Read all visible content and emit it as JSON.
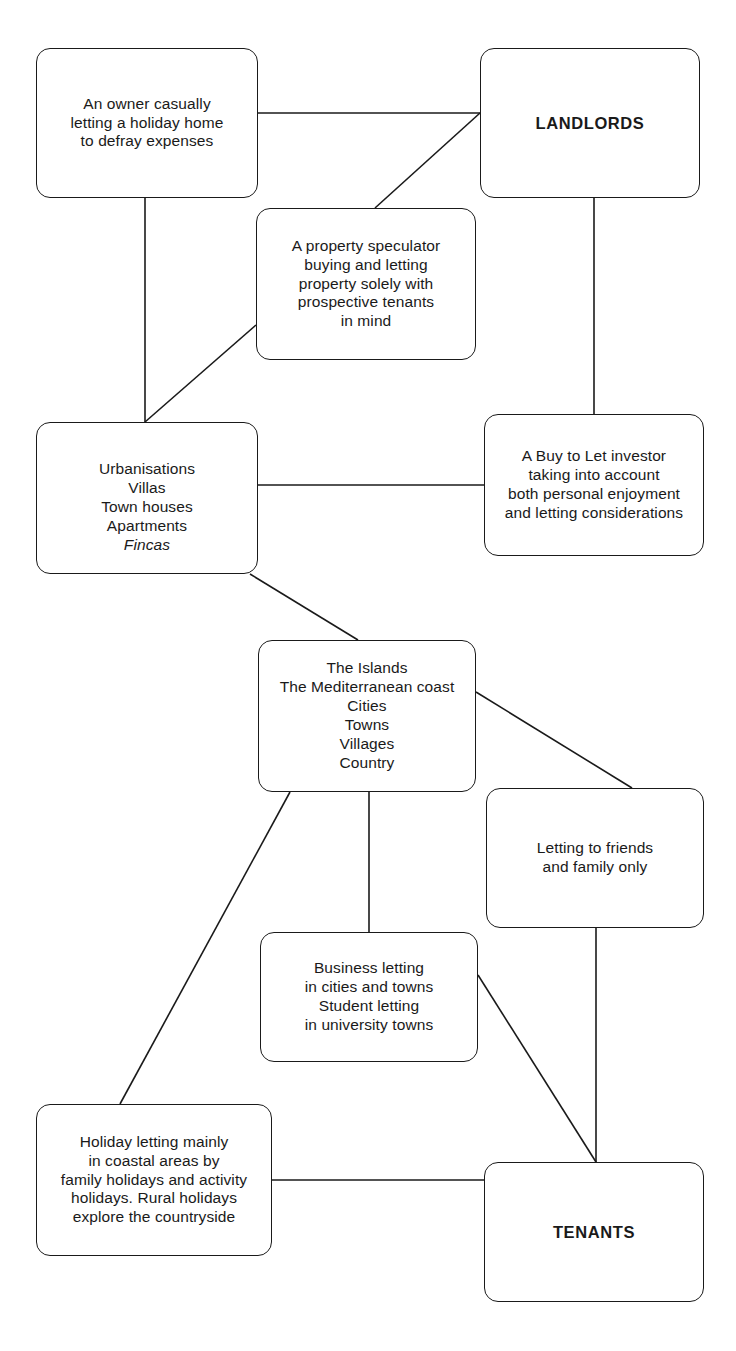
{
  "diagram": {
    "type": "flow-diagram",
    "background_color": "#ffffff",
    "line_color": "#1a1a1a",
    "nodes": [
      {
        "id": "owner-casual",
        "label": "An owner casually\nletting a holiday home\nto defray expenses",
        "emphasis": false,
        "x": 36,
        "y": 48,
        "w": 222,
        "h": 150
      },
      {
        "id": "landlords",
        "label": "LANDLORDS",
        "emphasis": true,
        "x": 480,
        "y": 48,
        "w": 220,
        "h": 150
      },
      {
        "id": "property-speculator",
        "label": "A property speculator\nbuying and letting\nproperty solely with\nprospective tenants\nin mind",
        "emphasis": false,
        "x": 256,
        "y": 208,
        "w": 220,
        "h": 152
      },
      {
        "id": "property-types",
        "label": "Urbanisations\nVillas\nTown houses\nApartments",
        "italic_label": "Fincas",
        "emphasis": false,
        "x": 36,
        "y": 422,
        "w": 222,
        "h": 152
      },
      {
        "id": "buy-to-let",
        "label": "A Buy to Let investor\ntaking into account\nboth personal enjoyment\nand letting considerations",
        "emphasis": false,
        "x": 484,
        "y": 414,
        "w": 220,
        "h": 142
      },
      {
        "id": "locations",
        "label": "The Islands\nThe Mediterranean coast\nCities\nTowns\nVillages\nCountry",
        "emphasis": false,
        "x": 258,
        "y": 640,
        "w": 218,
        "h": 152
      },
      {
        "id": "friends-family",
        "label": "Letting to friends\nand family only",
        "emphasis": false,
        "x": 486,
        "y": 788,
        "w": 218,
        "h": 140
      },
      {
        "id": "business-student",
        "label": "Business letting\nin cities and towns\nStudent letting\nin university towns",
        "emphasis": false,
        "x": 260,
        "y": 932,
        "w": 218,
        "h": 130
      },
      {
        "id": "holiday-letting",
        "label": "Holiday letting mainly\nin coastal areas by\nfamily holidays and activity\nholidays. Rural holidays\nexplore the countryside",
        "emphasis": false,
        "x": 36,
        "y": 1104,
        "w": 236,
        "h": 152
      },
      {
        "id": "tenants",
        "label": "TENANTS",
        "emphasis": true,
        "x": 484,
        "y": 1162,
        "w": 220,
        "h": 140
      }
    ],
    "connectors": [
      {
        "id": "owner-to-landlords",
        "from": "owner-casual",
        "to": "landlords",
        "points": "258,113 480,113"
      },
      {
        "id": "landlords-to-speculator",
        "from": "landlords",
        "to": "property-speculator",
        "points": "480,113 375,208"
      },
      {
        "id": "owner-to-property-types",
        "from": "owner-casual",
        "to": "property-types",
        "points": "145,198 145,422"
      },
      {
        "id": "speculator-to-property-types",
        "from": "property-speculator",
        "to": "property-types",
        "points": "256,325 145,422"
      },
      {
        "id": "landlords-to-buy-to-let",
        "from": "landlords",
        "to": "buy-to-let",
        "points": "594,198 594,414"
      },
      {
        "id": "property-types-to-buy-to-let",
        "from": "property-types",
        "to": "buy-to-let",
        "points": "258,485 484,485"
      },
      {
        "id": "property-types-to-locations",
        "from": "property-types",
        "to": "locations",
        "points": "250,574 358,640"
      },
      {
        "id": "locations-to-friends-family",
        "from": "locations",
        "to": "friends-family",
        "points": "476,692 632,788"
      },
      {
        "id": "locations-to-business-student",
        "from": "locations",
        "to": "business-student",
        "points": "369,792 369,932"
      },
      {
        "id": "locations-to-holiday-letting",
        "from": "locations",
        "to": "holiday-letting",
        "points": "290,792 120,1104"
      },
      {
        "id": "friends-family-to-tenants",
        "from": "friends-family",
        "to": "tenants",
        "points": "596,928 596,1162"
      },
      {
        "id": "business-student-to-tenants",
        "from": "business-student",
        "to": "tenants",
        "points": "478,975 596,1162"
      },
      {
        "id": "holiday-letting-to-tenants",
        "from": "holiday-letting",
        "to": "tenants",
        "points": "272,1180 484,1180"
      }
    ]
  }
}
